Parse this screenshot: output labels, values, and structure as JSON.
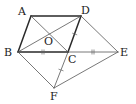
{
  "figure": {
    "type": "geometry",
    "points": [
      {
        "id": "A",
        "label": "A"
      },
      {
        "id": "B",
        "label": "B"
      },
      {
        "id": "C",
        "label": "C"
      },
      {
        "id": "D",
        "label": "D"
      },
      {
        "id": "E",
        "label": "E"
      },
      {
        "id": "F",
        "label": "F"
      },
      {
        "id": "O",
        "label": "O"
      }
    ],
    "segments": [
      {
        "from": "A",
        "to": "B",
        "style": "thick"
      },
      {
        "from": "A",
        "to": "D",
        "style": "thick"
      },
      {
        "from": "B",
        "to": "C",
        "style": "thick"
      },
      {
        "from": "C",
        "to": "D",
        "style": "thick"
      },
      {
        "from": "A",
        "to": "C",
        "style": "thin"
      },
      {
        "from": "B",
        "to": "D",
        "style": "thin"
      },
      {
        "from": "C",
        "to": "E",
        "style": "thin"
      },
      {
        "from": "D",
        "to": "E",
        "style": "thin"
      },
      {
        "from": "B",
        "to": "F",
        "style": "thin"
      },
      {
        "from": "C",
        "to": "F",
        "style": "thin"
      },
      {
        "from": "F",
        "to": "E",
        "style": "thin"
      }
    ],
    "equal_marks": [
      {
        "segment": "BC",
        "ticks": 2
      },
      {
        "segment": "CE",
        "ticks": 2
      },
      {
        "segment": "DC",
        "ticks": 1
      },
      {
        "segment": "CF",
        "ticks": 1
      }
    ]
  }
}
